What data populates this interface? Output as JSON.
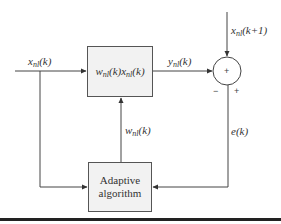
{
  "diagram": {
    "type": "adaptive-filter-block-diagram",
    "blocks": {
      "filter": {
        "label_w": "w",
        "label_w_sub": "nl",
        "label_mid": "(k)",
        "label_x": "x",
        "label_x_sub": "nl",
        "label_end": "(k)"
      },
      "adaptive": {
        "line1": "Adaptive",
        "line2": "algorithm"
      }
    },
    "signals": {
      "input": {
        "base": "x",
        "sub": "nl",
        "arg": "(k)"
      },
      "output": {
        "base": "y",
        "sub": "nl",
        "arg": "(k)"
      },
      "desired": {
        "base": "x",
        "sub": "nl",
        "arg": "(k+1)"
      },
      "weights": {
        "base": "w",
        "sub": "nl",
        "arg": "(k)"
      },
      "error": {
        "text": "e(k)"
      }
    },
    "summing_junction": {
      "center_symbol": "+",
      "minus_sign": "−",
      "plus_sign": "+"
    }
  },
  "colors": {
    "line": "#444444",
    "box_fill": "#f2f2f2",
    "rule": "#222222"
  }
}
